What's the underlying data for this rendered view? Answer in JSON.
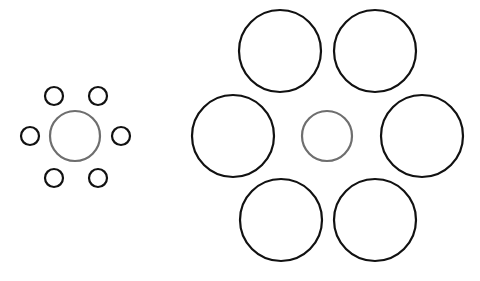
{
  "diagram": {
    "background": "#ffffff",
    "groups": [
      {
        "name": "small-surround",
        "center": {
          "cx": 75,
          "cy": 136,
          "r": 25,
          "stroke": "#6e6e6e"
        },
        "surround": [
          {
            "cx": 54,
            "cy": 96,
            "r": 9
          },
          {
            "cx": 98,
            "cy": 96,
            "r": 9
          },
          {
            "cx": 30,
            "cy": 136,
            "r": 9
          },
          {
            "cx": 121,
            "cy": 136,
            "r": 9
          },
          {
            "cx": 54,
            "cy": 178,
            "r": 9
          },
          {
            "cx": 98,
            "cy": 178,
            "r": 9
          }
        ],
        "surround_stroke": "#111111"
      },
      {
        "name": "large-surround",
        "center": {
          "cx": 327,
          "cy": 136,
          "r": 25,
          "stroke": "#6e6e6e"
        },
        "surround": [
          {
            "cx": 280,
            "cy": 51,
            "r": 41
          },
          {
            "cx": 375,
            "cy": 51,
            "r": 41
          },
          {
            "cx": 233,
            "cy": 136,
            "r": 41
          },
          {
            "cx": 422,
            "cy": 136,
            "r": 41
          },
          {
            "cx": 281,
            "cy": 220,
            "r": 41
          },
          {
            "cx": 375,
            "cy": 220,
            "r": 41
          }
        ],
        "surround_stroke": "#111111"
      }
    ]
  }
}
